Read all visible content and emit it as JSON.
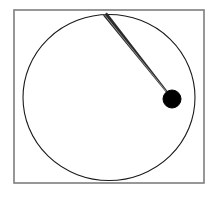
{
  "figure": {
    "title": "Pendulum bob on circular path",
    "type": "diagram",
    "canvas": {
      "width": 220,
      "height": 198,
      "background_color": "#ffffff"
    },
    "frame": {
      "label": "Outer rectangular frame",
      "x": 14,
      "y": 10,
      "width": 190,
      "height": 173,
      "stroke_color": "#7d7d7d",
      "stroke_width": 1.6,
      "fill": "none"
    },
    "circle": {
      "label": "Circular path of the bob",
      "center_x": 109,
      "center_y": 97.5,
      "radius_x": 86,
      "radius_y": 83,
      "stroke_color": "#1a1a1a",
      "stroke_width": 1.1,
      "fill": "none"
    },
    "rod": {
      "label": "Pendulum rod",
      "pivot_x": 105,
      "pivot_y": 14,
      "bob_x": 171,
      "bob_y": 97,
      "stroke_color": "#2b2b2b",
      "width_at_pivot": 5.0,
      "width_at_bob": 1.8,
      "highlight_color": "#8c8c8c"
    },
    "bob": {
      "label": "Pendulum bob",
      "center_x": 172,
      "center_y": 99,
      "radius": 9,
      "fill_color": "#000000",
      "stroke_color": "#000000"
    }
  }
}
